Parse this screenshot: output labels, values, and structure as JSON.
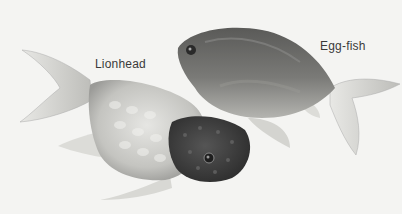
{
  "image": {
    "description": "Grayscale illustration of two fancy goldfish",
    "labels": {
      "lionhead": "Lionhead",
      "eggfish": "Egg-fish"
    },
    "colors": {
      "background": "#f4f4f2",
      "lionhead_body": "#c9c9c6",
      "lionhead_head": "#3c3c3c",
      "eggfish_body": "#6e6e6c",
      "fins": "#d8d8d5",
      "label_text": "#3a3a3a"
    }
  }
}
